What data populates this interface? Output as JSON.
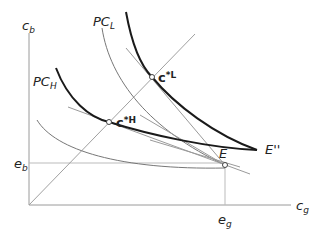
{
  "diagram": {
    "axes": {
      "y_label": "c",
      "y_sub": "b",
      "x_label": "c",
      "x_sub": "g"
    },
    "ticks": {
      "eb": {
        "label": "e",
        "sub": "b"
      },
      "eg": {
        "label": "e",
        "sub": "g"
      }
    },
    "curves": {
      "pcl": {
        "label": "PC",
        "sub": "L"
      },
      "pch": {
        "label": "PC",
        "sub": "H"
      },
      "epp": {
        "label": "E''"
      }
    },
    "points": {
      "e": {
        "label": "E"
      },
      "cstar_l": {
        "label": "c",
        "sup": "*L"
      },
      "cstar_h": {
        "label": "c",
        "sup": "*H"
      }
    },
    "colors": {
      "thick_curve": "#1a1a1a",
      "thin_line": "#8c8c8c",
      "axis": "#9a9a9a"
    }
  }
}
